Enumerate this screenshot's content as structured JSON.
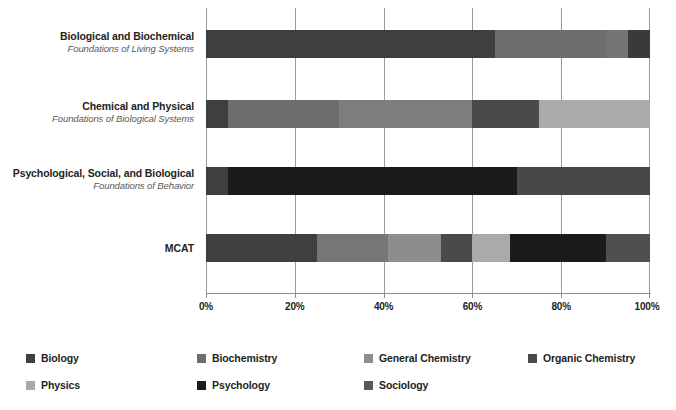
{
  "chart_data": {
    "type": "bar",
    "orientation": "horizontal",
    "stacked": true,
    "normalized_percent": true,
    "title": "",
    "subtitle": "",
    "xlabel": "",
    "ylabel": "",
    "xlim": [
      0,
      100
    ],
    "xtick_labels": [
      "0%",
      "20%",
      "40%",
      "60%",
      "80%",
      "100%"
    ],
    "xticks": [
      0,
      20,
      40,
      60,
      80,
      100
    ],
    "grid": true,
    "legend_position": "bottom",
    "categories": [
      {
        "primary": "Biological and Biochemical",
        "secondary": "Foundations of Living Systems"
      },
      {
        "primary": "Chemical and Physical",
        "secondary": "Foundations of Biological Systems"
      },
      {
        "primary": "Psychological, Social, and Biological",
        "secondary": "Foundations of Behavior"
      },
      {
        "primary": "MCAT",
        "secondary": ""
      }
    ],
    "series": [
      {
        "name": "Biology",
        "color": "#3f3f41",
        "values": [
          65,
          0,
          5,
          25
        ]
      },
      {
        "name": "Biochemistry",
        "color": "#6d6e70",
        "values": [
          25,
          25,
          0,
          16
        ]
      },
      {
        "name": "General Chemistry",
        "color": "#8c8d8f",
        "values": [
          0,
          30,
          0,
          12
        ]
      },
      {
        "name": "Organic Chemistry",
        "color": "#4a4a4c",
        "values": [
          5,
          15,
          0,
          7
        ]
      },
      {
        "name": "Physics",
        "color": "#a9aaac",
        "values": [
          0,
          25,
          0,
          8
        ]
      },
      {
        "name": "Psychology",
        "color": "#231f20",
        "values": [
          0,
          0,
          65,
          22
        ]
      },
      {
        "name": "Sociology",
        "color": "#5a5a5c",
        "values": [
          5,
          5,
          30,
          10
        ]
      }
    ],
    "stacks": [
      {
        "category": "Biological and Biochemical",
        "segments": [
          {
            "name": "Biology",
            "start": 0,
            "end": 65,
            "value": 65,
            "color": "#3f3f41"
          },
          {
            "name": "Biochemistry",
            "start": 65,
            "end": 90,
            "value": 25,
            "color": "#6d6e70"
          },
          {
            "name": "Organic Chemistry",
            "start": 90,
            "end": 95,
            "value": 5,
            "color": "#757577"
          },
          {
            "name": "Sociology",
            "start": 95,
            "end": 100,
            "value": 5,
            "color": "#3a3a3c"
          }
        ]
      },
      {
        "category": "Chemical and Physical",
        "segments": [
          {
            "name": "Biology",
            "start": 0,
            "end": 5,
            "value": 5,
            "color": "#3f3f41"
          },
          {
            "name": "Biochemistry",
            "start": 5,
            "end": 30,
            "value": 25,
            "color": "#6d6e70"
          },
          {
            "name": "General Chemistry",
            "start": 30,
            "end": 60,
            "value": 30,
            "color": "#7c7d7f"
          },
          {
            "name": "Organic Chemistry",
            "start": 60,
            "end": 75,
            "value": 15,
            "color": "#4a4a4c"
          },
          {
            "name": "Physics",
            "start": 75,
            "end": 100,
            "value": 25,
            "color": "#a9aaac"
          }
        ]
      },
      {
        "category": "Psychological, Social, and Biological",
        "segments": [
          {
            "name": "Biology",
            "start": 0,
            "end": 5,
            "value": 5,
            "color": "#3f3f41"
          },
          {
            "name": "Psychology",
            "start": 5,
            "end": 70,
            "value": 65,
            "color": "#1c1a1b"
          },
          {
            "name": "Sociology",
            "start": 70,
            "end": 100,
            "value": 30,
            "color": "#48484a"
          }
        ]
      },
      {
        "category": "MCAT",
        "segments": [
          {
            "name": "Biology",
            "start": 0,
            "end": 25,
            "value": 25,
            "color": "#3f3f41"
          },
          {
            "name": "Biochemistry",
            "start": 25,
            "end": 41,
            "value": 16,
            "color": "#757678"
          },
          {
            "name": "General Chemistry",
            "start": 41,
            "end": 53,
            "value": 12,
            "color": "#8c8d8f"
          },
          {
            "name": "Organic Chemistry",
            "start": 53,
            "end": 60,
            "value": 7,
            "color": "#4a4a4c"
          },
          {
            "name": "Physics",
            "start": 60,
            "end": 68.5,
            "value": 8.5,
            "color": "#a9aaac"
          },
          {
            "name": "Psychology",
            "start": 68.5,
            "end": 90,
            "value": 21.5,
            "color": "#1c1a1b"
          },
          {
            "name": "Sociology",
            "start": 90,
            "end": 100,
            "value": 10,
            "color": "#4f4f51"
          }
        ]
      }
    ],
    "legend": [
      {
        "label": "Biology",
        "color": "#3f3f41"
      },
      {
        "label": "Biochemistry",
        "color": "#6d6e70"
      },
      {
        "label": "General Chemistry",
        "color": "#8c8d8f"
      },
      {
        "label": "Organic Chemistry",
        "color": "#4a4a4c"
      },
      {
        "label": "Physics",
        "color": "#a9aaac"
      },
      {
        "label": "Psychology",
        "color": "#1c1a1b"
      },
      {
        "label": "Sociology",
        "color": "#5a5a5c"
      }
    ]
  },
  "axis": {
    "gridline_color": "#9b9b9b",
    "baseline_color": "#8e8e8e"
  }
}
